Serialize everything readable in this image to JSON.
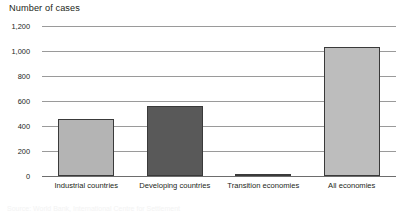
{
  "chart_data": {
    "type": "bar",
    "title": "Number of cases",
    "xlabel": "",
    "ylabel": "",
    "categories": [
      "Industrial countries",
      "Developing countries",
      "Transition economies",
      "All economies"
    ],
    "values": [
      460,
      560,
      12,
      1030
    ],
    "series": [
      {
        "name": "Number of cases",
        "values": [
          460,
          560,
          12,
          1030
        ]
      }
    ],
    "bar_colors": [
      "#b4b4b4",
      "#595959",
      "#4a4a4a",
      "#bdbdbd"
    ],
    "ylim": [
      0,
      1200
    ],
    "yticks": [
      0,
      200,
      400,
      600,
      800,
      1000,
      1200
    ],
    "ytick_labels": [
      "0",
      "200",
      "400",
      "600",
      "800",
      "1,000",
      "1,200"
    ],
    "grid": true,
    "legend": "none"
  },
  "figure": {
    "axis_line_color": "#9a9a9a",
    "baseline_color": "#6d6d6d",
    "background": "#ffffff",
    "text_color": "#231f20"
  },
  "footnote": {
    "text": "Source: World Bank, International Centre for Settlement"
  }
}
